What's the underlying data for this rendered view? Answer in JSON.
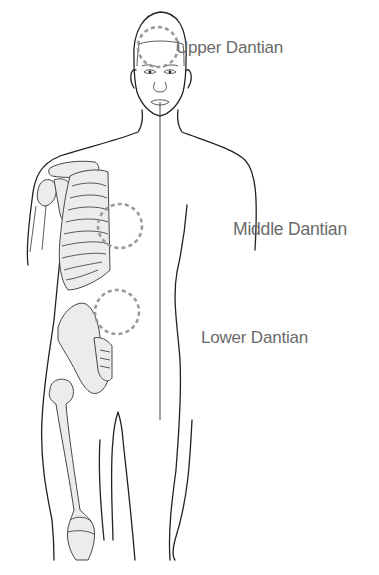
{
  "figure": {
    "labels": {
      "upper": "Upper Dantian",
      "middle": "Middle Dantian",
      "lower": "Lower Dantian"
    },
    "colors": {
      "label_text": "#6a6a6a",
      "dashed_circle": "#9a9a9a",
      "outline": "#222222",
      "bone_fill": "#ececec",
      "background": "#ffffff"
    },
    "markers": [
      {
        "name": "upper-dantian",
        "cx": 158,
        "cy": 47,
        "r": 20
      },
      {
        "name": "middle-dantian",
        "cx": 120,
        "cy": 226,
        "r": 22
      },
      {
        "name": "lower-dantian",
        "cx": 117,
        "cy": 312,
        "r": 22
      }
    ]
  }
}
